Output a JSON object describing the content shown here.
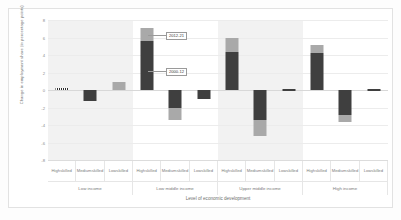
{
  "chart_data": {
    "type": "bar",
    "title": "",
    "xlabel": "Level of economic development",
    "ylabel": "Change in employment share (in percentage points)",
    "ylim": [
      -8,
      8
    ],
    "yticks": [
      8,
      6,
      4,
      2,
      0,
      -2,
      -4,
      -6,
      -8
    ],
    "ytick_labels": [
      "8",
      "6",
      "4",
      "2",
      "0",
      "-2",
      "-4",
      "-6",
      "-8"
    ],
    "grid": true,
    "legend_position": "annotated-callouts",
    "stacked": true,
    "groups": [
      {
        "label": "Low income",
        "categories": [
          "High skilled",
          "Medium skilled",
          "Low skilled"
        ]
      },
      {
        "label": "Low middle income",
        "categories": [
          "High skilled",
          "Medium skilled",
          "Low skilled"
        ]
      },
      {
        "label": "Upper middle income",
        "categories": [
          "High skilled",
          "Medium skilled",
          "Low skilled"
        ]
      },
      {
        "label": "High income",
        "categories": [
          "High skilled",
          "Medium skilled",
          "Low skilled"
        ]
      }
    ],
    "series": [
      {
        "name": "2000-12",
        "color": "#3f3f3f",
        "values": [
          0.2,
          -1.2,
          0.0,
          5.6,
          -2.0,
          -1.0,
          4.4,
          -3.4,
          0.1,
          4.2,
          -2.8,
          0.1
        ]
      },
      {
        "name": "2012-21",
        "color": "#a9a9a9",
        "values": [
          0.0,
          0.0,
          0.9,
          1.5,
          -1.4,
          0.0,
          1.6,
          -1.8,
          0.0,
          1.0,
          -0.8,
          0.0
        ]
      }
    ],
    "bar_labels": [
      "Low income / High skilled",
      "Low income / Medium skilled",
      "Low income / Low skilled",
      "Low middle income / High skilled",
      "Low middle income / Medium skilled",
      "Low middle income / Low skilled",
      "Upper middle income / High skilled",
      "Upper middle income / Medium skilled",
      "Upper middle income / Low skilled",
      "High income / High skilled",
      "High income / Medium skilled",
      "High income / Low skilled"
    ],
    "annotations": [
      {
        "text": "2012-21",
        "target": "Low middle income / High skilled upper segment"
      },
      {
        "text": "2000-12",
        "target": "Low middle income / High skilled lower segment"
      }
    ]
  }
}
